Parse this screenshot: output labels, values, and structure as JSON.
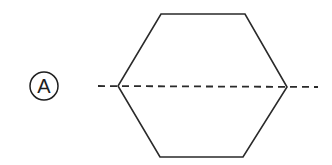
{
  "diagram": {
    "option_label": "A",
    "colors": {
      "stroke": "#2a2a2a",
      "background": "#ffffff"
    },
    "hexagon": {
      "points": [
        [
          161,
          14
        ],
        [
          245,
          14
        ],
        [
          287,
          87
        ],
        [
          243,
          157
        ],
        [
          160,
          157
        ],
        [
          118,
          86
        ]
      ]
    },
    "symmetry_line": {
      "style": "dashed",
      "x1": 98,
      "y1": 86,
      "x2": 318,
      "y2": 87
    }
  }
}
